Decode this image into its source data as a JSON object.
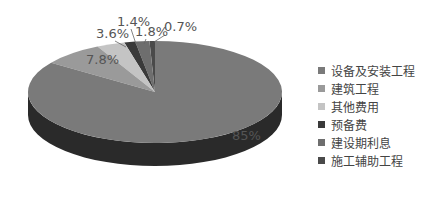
{
  "chart_data": {
    "type": "pie",
    "style": "3d",
    "title": "",
    "categories": [
      "设备及安装工程",
      "建筑工程",
      "其他费用",
      "预备费",
      "建设期利息",
      "施工辅助工程"
    ],
    "values": [
      85,
      7.8,
      3.6,
      1.4,
      1.8,
      0.7
    ],
    "labels": [
      "85%",
      "7.8%",
      "3.6%",
      "1.4%",
      "1.8%",
      "0.7%"
    ],
    "colors": [
      "#7a7a7a",
      "#9a9a9a",
      "#c4c4c4",
      "#3a3a3a",
      "#6e6e6e",
      "#4a4a4a"
    ],
    "legend_position": "right"
  },
  "legend": {
    "items": [
      {
        "label": "设备及安装工程",
        "color": "#7a7a7a"
      },
      {
        "label": "建筑工程",
        "color": "#9a9a9a"
      },
      {
        "label": "其他费用",
        "color": "#c4c4c4"
      },
      {
        "label": "预备费",
        "color": "#3a3a3a"
      },
      {
        "label": "建设期利息",
        "color": "#6e6e6e"
      },
      {
        "label": "施工辅助工程",
        "color": "#4a4a4a"
      }
    ]
  }
}
